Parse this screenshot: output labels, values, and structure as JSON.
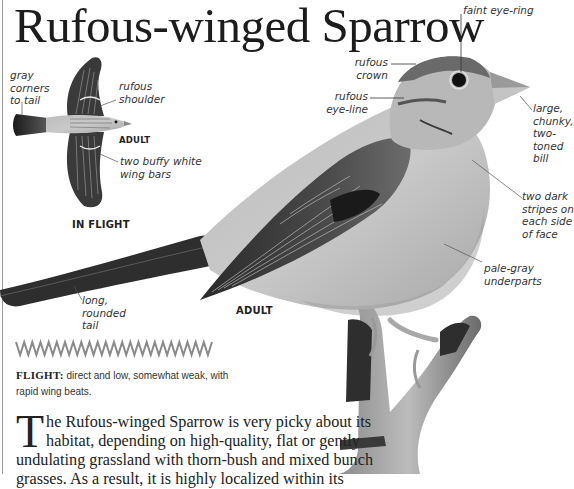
{
  "page": {
    "title": "Rufous-winged Sparrow"
  },
  "in_flight": {
    "caption": "IN FLIGHT",
    "age_label": "ADULT",
    "annotations": {
      "tail_corners": "gray\ncorners\nto tail",
      "shoulder": "rufous\nshoulder",
      "wing_bars": "two buffy white\nwing bars"
    }
  },
  "perched": {
    "age_label": "ADULT",
    "annotations": {
      "eye_ring": "faint eye-ring",
      "crown": "rufous\ncrown",
      "eye_line": "rufous\neye-line",
      "bill": "large,\nchunky,\ntwo-\ntoned\nbill",
      "face_stripes": "two dark\nstripes on\neach side\nof face",
      "underparts": "pale-gray\nunderparts",
      "tail": "long,\nrounded\ntail"
    }
  },
  "flight": {
    "label": "FLIGHT:",
    "description": " direct and low, somewhat weak, with rapid wing beats."
  },
  "body": {
    "dropcap": "T",
    "text": "he Rufous-winged Sparrow is very picky about its habitat, depending on high-quality, flat or gently undulating grassland with thorn-bush and mixed bunch grasses. As a result, it is highly localized within its"
  },
  "colors": {
    "ink": "#222222",
    "annotation": "#333333",
    "zigzag": "#8a8a8a",
    "page_edge": "#9a9a9a"
  }
}
